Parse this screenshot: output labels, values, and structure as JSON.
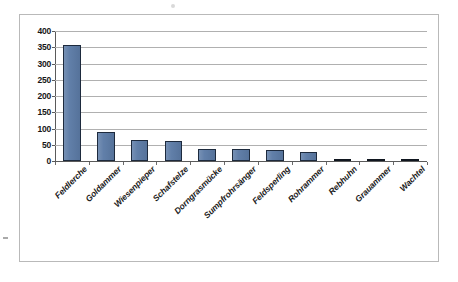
{
  "chart_data": {
    "type": "bar",
    "title": "",
    "subtitle": "",
    "xlabel": "",
    "ylabel": "",
    "categories": [
      "Feldlerche",
      "Goldammer",
      "Wiesenpieper",
      "Schafstelze",
      "Dorngrasmücke",
      "Sumpfrohrsänger",
      "Feldsperling",
      "Rohrammer",
      "Rebhuhn",
      "Grauammer",
      "Wachtel"
    ],
    "values": [
      358,
      88,
      65,
      62,
      38,
      36,
      33,
      28,
      5,
      3,
      1
    ],
    "ylim": [
      0,
      400
    ],
    "ytick_step": 50,
    "ytick_labels": [
      "0",
      "50",
      "100",
      "150",
      "200",
      "250",
      "300",
      "350",
      "400"
    ],
    "grid": "horizontal",
    "legend": "none",
    "series": [
      {
        "name": "",
        "values": [
          358,
          88,
          65,
          62,
          38,
          36,
          33,
          28,
          5,
          3,
          1
        ]
      }
    ],
    "colors": {
      "bar_fill": "#5c7ba6",
      "bar_border": "#1d2a3d",
      "gridline": "#b0b0b0",
      "axis": "#5a5a5a",
      "frame": "#b9b9b9",
      "text": "#161616",
      "background": "#ffffff"
    }
  }
}
